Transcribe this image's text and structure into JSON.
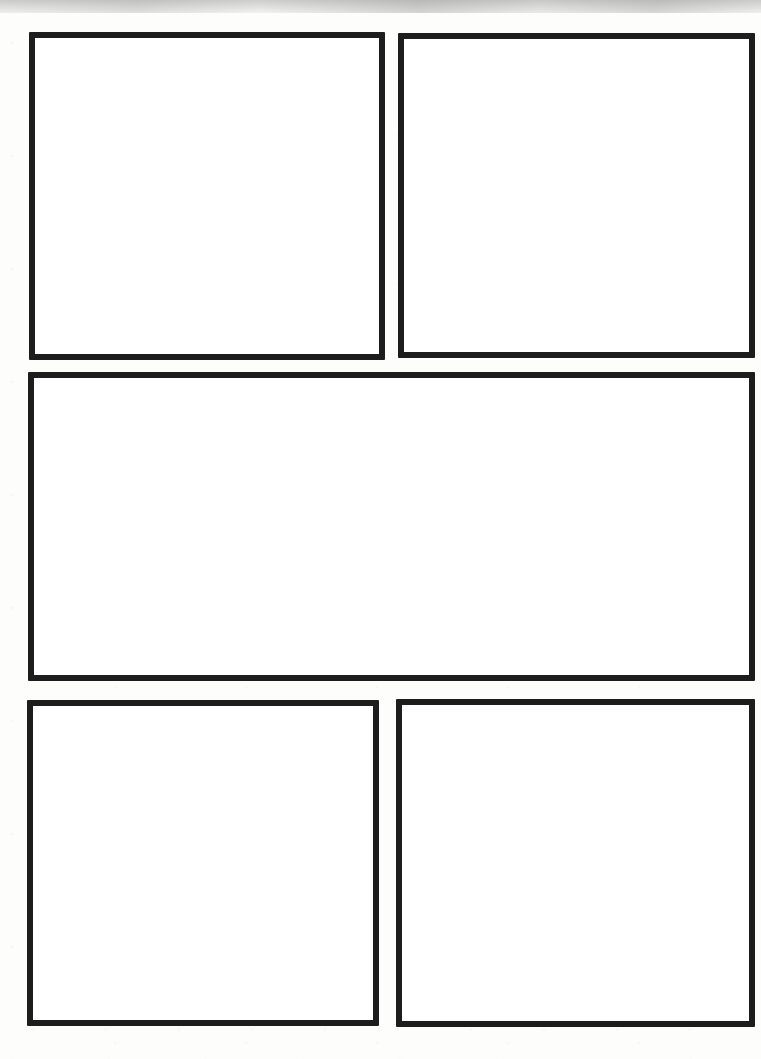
{
  "page": {
    "type": "blank-comic-page-template",
    "panel_count": 5,
    "text_content": "",
    "colors": {
      "page_bg": "#fdfdfc",
      "panel_fill": "#ffffff",
      "panel_border": "#1d1d1d",
      "scan_noise": "#d9d9d9"
    },
    "panels": [
      {
        "id": "panel-1",
        "position": "top-left",
        "row": 1,
        "content": ""
      },
      {
        "id": "panel-2",
        "position": "top-right",
        "row": 1,
        "content": ""
      },
      {
        "id": "panel-3",
        "position": "middle-wide",
        "row": 2,
        "content": ""
      },
      {
        "id": "panel-4",
        "position": "bottom-left",
        "row": 3,
        "content": ""
      },
      {
        "id": "panel-5",
        "position": "bottom-right",
        "row": 3,
        "content": ""
      }
    ]
  }
}
